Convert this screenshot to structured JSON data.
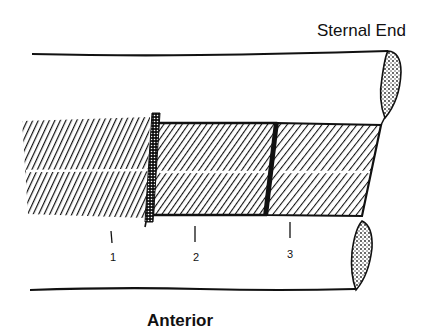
{
  "diagram": {
    "labels": {
      "top_right": "Sternal End",
      "bottom": "Anterior"
    },
    "markers": [
      {
        "id": "1",
        "label": "1"
      },
      {
        "id": "2",
        "label": "2"
      },
      {
        "id": "3",
        "label": "3"
      }
    ],
    "colors": {
      "ink": "#111111",
      "background": "#ffffff"
    }
  }
}
